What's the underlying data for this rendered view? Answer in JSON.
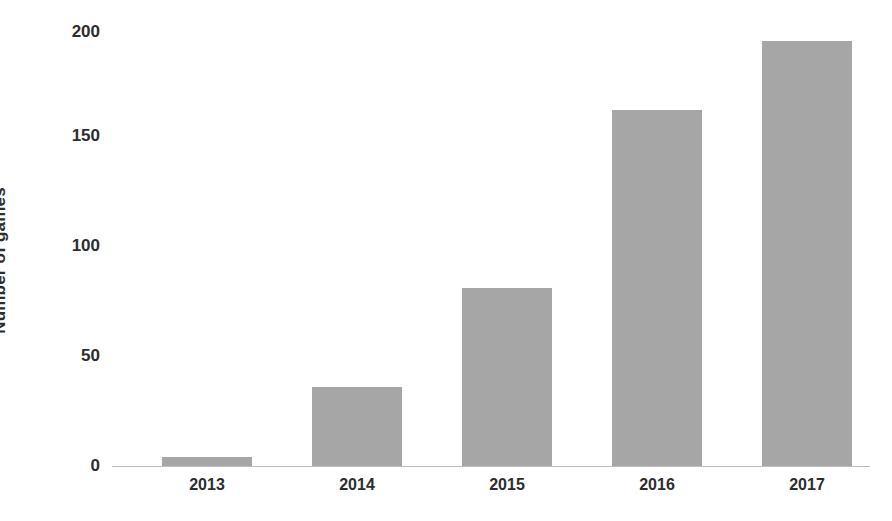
{
  "chart_data": {
    "type": "bar",
    "title": "",
    "xlabel": "",
    "ylabel": "Number of games",
    "categories": [
      "2013",
      "2014",
      "2015",
      "2016",
      "2017"
    ],
    "values": [
      4,
      36,
      81,
      162,
      193
    ],
    "series": [
      {
        "name": "Number of games",
        "values": [
          4,
          36,
          81,
          162,
          193
        ]
      }
    ],
    "ylim": [
      0,
      200
    ],
    "yticks": [
      0,
      50,
      100,
      150,
      200
    ],
    "ytick_labels": [
      "0",
      "50",
      "100",
      "150",
      "200"
    ],
    "grid": false,
    "legend": false,
    "legend_position": "none",
    "bar_color": "#a6a6a6",
    "axis_color": "#bdbdbd",
    "text_color": "#2d2d2d",
    "background_color": "#ffffff"
  }
}
